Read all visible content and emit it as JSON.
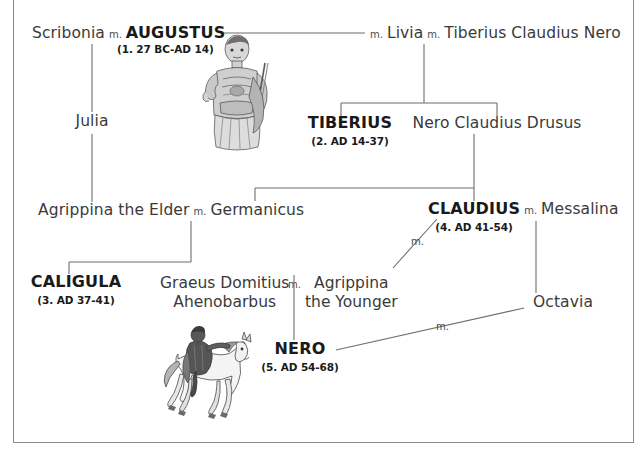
{
  "diagram": {
    "type": "genealogy",
    "marriage_label": "m",
    "line_color": "#6e6e6e",
    "border_color": "#8a8a8a",
    "text_color": "#3a3a3a",
    "emperor_text_color": "#1a1a1a"
  },
  "people": {
    "scribonia": {
      "label": "Scribonia"
    },
    "augustus": {
      "label": "AUGUSTUS",
      "reign": "(1. 27 BC-AD 14)"
    },
    "livia": {
      "label": "Livia"
    },
    "tiberius_claudius_nero": {
      "label": "Tiberius Claudius Nero"
    },
    "julia": {
      "label": "Julia"
    },
    "tiberius": {
      "label": "TIBERIUS",
      "reign": "(2. AD 14-37)"
    },
    "nero_claudius_drusus": {
      "label": "Nero Claudius Drusus"
    },
    "agrippina_elder": {
      "label": "Agrippina the Elder"
    },
    "germanicus": {
      "label": "Germanicus"
    },
    "claudius": {
      "label": "CLAUDIUS",
      "reign": "(4. AD 41-54)"
    },
    "messalina": {
      "label": "Messalina"
    },
    "caligula": {
      "label": "CALIGULA",
      "reign": "(3. AD 37-41)"
    },
    "graeus_domitius": {
      "label_line1": "Graeus Domitius",
      "label_line2": "Ahenobarbus"
    },
    "agrippina_younger": {
      "label_line1": "Agrippina",
      "label_line2": "the Younger"
    },
    "octavia": {
      "label": "Octavia"
    },
    "nero": {
      "label": "NERO",
      "reign": "(5. AD 54-68)"
    }
  },
  "illustrations": {
    "augustus_statue": {
      "name": "augustus-statue-illustration",
      "alt": "Statue of Augustus in armour holding a spear"
    },
    "nero_horseback": {
      "name": "nero-horseback-illustration",
      "alt": "Engraving of Nero riding a horse"
    }
  },
  "marriages": [
    {
      "left": "Scribonia",
      "right": "AUGUSTUS"
    },
    {
      "left": "AUGUSTUS",
      "right": "Livia"
    },
    {
      "left": "Livia",
      "right": "Tiberius Claudius Nero"
    },
    {
      "left": "Agrippina the Elder",
      "right": "Germanicus"
    },
    {
      "left": "CLAUDIUS",
      "right": "Messalina"
    },
    {
      "left": "CLAUDIUS",
      "right": "Agrippina the Younger"
    },
    {
      "left": "Graeus Domitius Ahenobarbus",
      "right": "Agrippina the Younger"
    },
    {
      "left": "NERO",
      "right": "Octavia"
    }
  ]
}
